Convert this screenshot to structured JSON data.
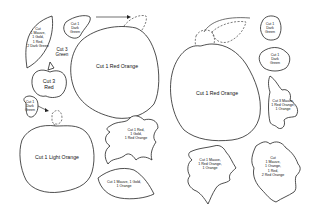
{
  "labels": {
    "left_leaf_big": "Cut\n1 Mauve,\n1 Gold,\n1 Red,\n2 Dark Green",
    "cut3_green": "Cut 3\nGreen",
    "small_apple": "Cut 3\nRed",
    "top_small_leaf": "Cut 1\nDark\nGreen",
    "left_stem_leaf": "Cut 1\nDark\nGreen",
    "apple_left_big": "Cut 1 Red Orange",
    "apple_light_orange": "Cut 1 Light Orange",
    "oak_leaf_left": "Cut 1 Red,\n1 Gold,\n1 Red Orange",
    "leaf_bottom_left": "Cut 1 Mauve, 1 Gold,\n1 Orange",
    "apple_right_big": "Cut 1 Red Orange",
    "right_leaf_1": "Cut 1\nDark\nGreen",
    "right_leaf_2": "Cut 1\nDark\nGreen",
    "right_oak": "Cut 3 Mauve,\n1 Red Orange,\n1 Orange",
    "maple_left": "Cut 1 Mauve,\n1 Red Orange,\n1 Orange",
    "maple_right": "Cut\n1 Mauve,\n1 Orange,\n1 Red,\n2 Red Orange"
  }
}
